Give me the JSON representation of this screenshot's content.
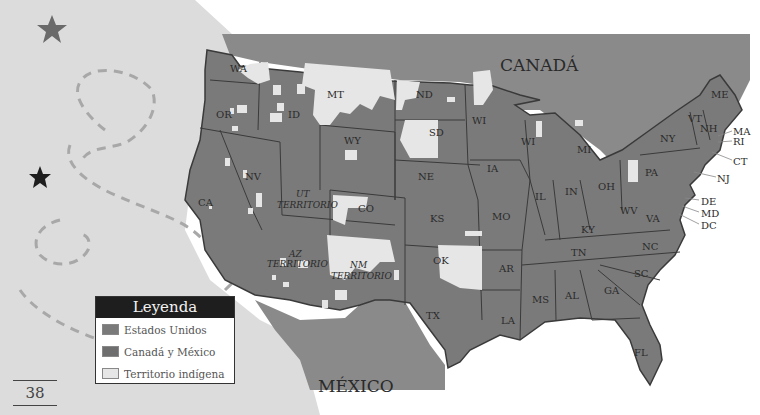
{
  "colors": {
    "ocean_left": "#dcdcdc",
    "background": "#ffffff",
    "united_states": "#7a7a7a",
    "canada_mexico": "#8a8a8a",
    "indigenous_territory": "#e6e6e6",
    "borders": "#3a3a3a",
    "dashed_path": "#a8a8a8",
    "star_gray": "#6a6a6a",
    "star_dark": "#1e1e1e"
  },
  "map": {
    "canada_label": "CANADÁ",
    "mexico_label": "MÉXICO",
    "states": [
      {
        "abbr": "WA",
        "x": 230,
        "y": 72
      },
      {
        "abbr": "OR",
        "x": 222,
        "y": 118
      },
      {
        "abbr": "ID",
        "x": 292,
        "y": 118
      },
      {
        "abbr": "MT",
        "x": 335,
        "y": 98
      },
      {
        "abbr": "WY",
        "x": 352,
        "y": 144
      },
      {
        "abbr": "ND",
        "x": 424,
        "y": 98
      },
      {
        "abbr": "SD",
        "x": 437,
        "y": 136
      },
      {
        "abbr": "WI",
        "x": 478,
        "y": 124
      },
      {
        "abbr": "WI",
        "x": 527,
        "y": 145
      },
      {
        "abbr": "MI",
        "x": 583,
        "y": 153
      },
      {
        "abbr": "IA",
        "x": 493,
        "y": 172
      },
      {
        "abbr": "NE",
        "x": 426,
        "y": 180
      },
      {
        "abbr": "NV",
        "x": 253,
        "y": 180
      },
      {
        "abbr": "CA",
        "x": 205,
        "y": 206
      },
      {
        "abbr": "CO",
        "x": 366,
        "y": 212
      },
      {
        "abbr": "KS",
        "x": 437,
        "y": 222
      },
      {
        "abbr": "MO",
        "x": 500,
        "y": 220
      },
      {
        "abbr": "IL",
        "x": 540,
        "y": 200
      },
      {
        "abbr": "IN",
        "x": 571,
        "y": 195
      },
      {
        "abbr": "OH",
        "x": 606,
        "y": 190
      },
      {
        "abbr": "PA",
        "x": 651,
        "y": 172
      },
      {
        "abbr": "NY",
        "x": 666,
        "y": 142
      },
      {
        "abbr": "ME",
        "x": 717,
        "y": 98
      },
      {
        "abbr": "VT",
        "x": 694,
        "y": 120
      },
      {
        "abbr": "NH",
        "x": 706,
        "y": 130
      },
      {
        "abbr": "WV",
        "x": 627,
        "y": 212
      },
      {
        "abbr": "VA",
        "x": 652,
        "y": 220
      },
      {
        "abbr": "KY",
        "x": 587,
        "y": 231
      },
      {
        "abbr": "TN",
        "x": 577,
        "y": 254
      },
      {
        "abbr": "NC",
        "x": 645,
        "y": 248
      },
      {
        "abbr": "SC",
        "x": 640,
        "y": 275
      },
      {
        "abbr": "GA",
        "x": 610,
        "y": 292
      },
      {
        "abbr": "AL",
        "x": 571,
        "y": 297
      },
      {
        "abbr": "MS",
        "x": 540,
        "y": 301
      },
      {
        "abbr": "AR",
        "x": 505,
        "y": 270
      },
      {
        "abbr": "LA",
        "x": 508,
        "y": 322
      },
      {
        "abbr": "TX",
        "x": 432,
        "y": 317
      },
      {
        "abbr": "OK",
        "x": 440,
        "y": 262
      },
      {
        "abbr": "FL",
        "x": 640,
        "y": 354
      }
    ],
    "territories": [
      {
        "abbr": "UT",
        "sub": "TERRITORIO",
        "x": 302,
        "y": 197
      },
      {
        "abbr": "AZ",
        "sub": "TERRITORIO",
        "x": 290,
        "y": 257
      },
      {
        "abbr": "NM",
        "sub": "TERRITORIO",
        "x": 355,
        "y": 267
      }
    ],
    "east_callouts": [
      {
        "abbr": "MA",
        "x": 735,
        "y": 134
      },
      {
        "abbr": "RI",
        "x": 735,
        "y": 144
      },
      {
        "abbr": "CT",
        "x": 735,
        "y": 164
      },
      {
        "abbr": "NJ",
        "x": 718,
        "y": 180
      },
      {
        "abbr": "DE",
        "x": 701,
        "y": 204
      },
      {
        "abbr": "MD",
        "x": 701,
        "y": 216
      },
      {
        "abbr": "DC",
        "x": 701,
        "y": 228
      }
    ]
  },
  "legend": {
    "title": "Leyenda",
    "items": [
      {
        "label": "Estados Unidos",
        "color": "#7a7a7a"
      },
      {
        "label": "Canadá y México",
        "color": "#6e6e6e"
      },
      {
        "label": "Territorio indígena",
        "color": "#e6e6e6"
      }
    ]
  },
  "page_number": "38"
}
